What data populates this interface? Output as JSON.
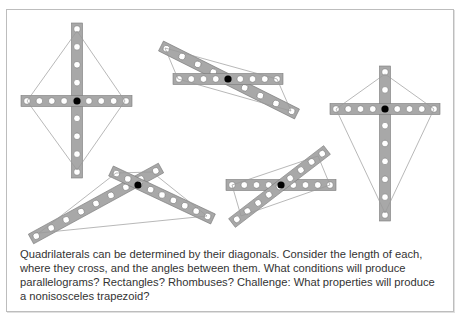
{
  "caption": "Quadrilaterals can be determined by their diagonals. Consider the length of each, where they cross, and the angles between them. What conditions will produce parallelograms? Rectangles? Rhombuses? Challenge: What properties will produce a nonisosceles trapezoid?",
  "colors": {
    "bar_fill": "#a8a8a8",
    "bar_stroke": "#7a7a7a",
    "hole_fill": "#ffffff",
    "pivot_fill": "#000000",
    "edge_line": "#9a9a9a",
    "frame_border": "#bdbdbd",
    "text": "#333333"
  },
  "figures": [
    {
      "name": "rhombus",
      "bars": [
        {
          "x1": 77,
          "y1": 23,
          "x2": 77,
          "y2": 178
        },
        {
          "x1": 21,
          "y1": 101,
          "x2": 132,
          "y2": 101
        }
      ],
      "pivot": [
        77,
        101
      ],
      "quad": [
        [
          77,
          31
        ],
        [
          125,
          101
        ],
        [
          77,
          170
        ],
        [
          27,
          101
        ]
      ]
    },
    {
      "name": "parallelogram-skew",
      "bars": [
        {
          "x1": 161,
          "y1": 46,
          "x2": 297,
          "y2": 114
        },
        {
          "x1": 173,
          "y1": 79,
          "x2": 283,
          "y2": 79
        }
      ],
      "pivot": [
        228,
        79
      ],
      "quad": [
        [
          165,
          48
        ],
        [
          277,
          79
        ],
        [
          291,
          111
        ],
        [
          178,
          79
        ]
      ]
    },
    {
      "name": "kite",
      "bars": [
        {
          "x1": 385,
          "y1": 66,
          "x2": 385,
          "y2": 221
        },
        {
          "x1": 330,
          "y1": 109,
          "x2": 440,
          "y2": 109
        }
      ],
      "pivot": [
        385,
        109
      ],
      "quad": [
        [
          385,
          74
        ],
        [
          434,
          109
        ],
        [
          385,
          213
        ],
        [
          336,
          109
        ]
      ]
    },
    {
      "name": "irregular-quadrilateral",
      "bars": [
        {
          "x1": 31,
          "y1": 239,
          "x2": 161,
          "y2": 168
        },
        {
          "x1": 111,
          "y1": 171,
          "x2": 213,
          "y2": 219
        }
      ],
      "pivot": [
        138,
        185
      ],
      "quad": [
        [
          116,
          173
        ],
        [
          152,
          172
        ],
        [
          207,
          216
        ],
        [
          39,
          233
        ]
      ]
    },
    {
      "name": "parallelogram",
      "bars": [
        {
          "x1": 226,
          "y1": 185,
          "x2": 336,
          "y2": 185
        },
        {
          "x1": 232,
          "y1": 223,
          "x2": 327,
          "y2": 150
        }
      ],
      "pivot": [
        281,
        185
      ],
      "quad": [
        [
          232,
          185
        ],
        [
          318,
          156
        ],
        [
          330,
          185
        ],
        [
          241,
          216
        ]
      ]
    }
  ]
}
